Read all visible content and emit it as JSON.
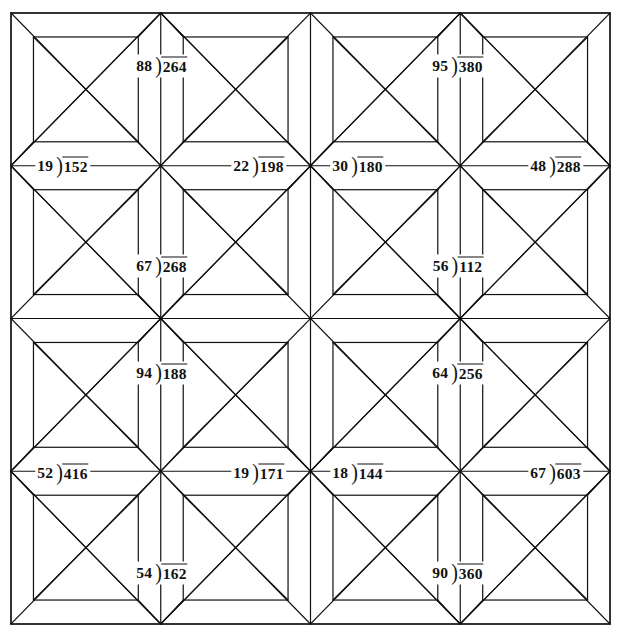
{
  "page": {
    "background_color": "#ffffff",
    "ink_color": "#111111",
    "width": 620,
    "height": 637
  },
  "quilt": {
    "frame": {
      "x": 11,
      "y": 13,
      "width": 599,
      "height": 611
    },
    "blocks_across": 2,
    "blocks_down": 2,
    "block_count": 4,
    "motif": "eight-pointed-star-with-corner-squares",
    "line_color": "#111111",
    "line_width": 1.2
  },
  "problems": [
    {
      "id": "b1-north",
      "block": 1,
      "position": "north",
      "divisor": "88",
      "bracket": ")",
      "dividend": "264",
      "x": 162,
      "y": 66
    },
    {
      "id": "b1-west",
      "block": 1,
      "position": "west",
      "divisor": "19",
      "bracket": ")",
      "dividend": "152",
      "x": 63,
      "y": 166
    },
    {
      "id": "b1-east",
      "block": 1,
      "position": "east",
      "divisor": "22",
      "bracket": ")",
      "dividend": "198",
      "x": 259,
      "y": 166
    },
    {
      "id": "b1-south",
      "block": 1,
      "position": "south",
      "divisor": "67",
      "bracket": ")",
      "dividend": "268",
      "x": 162,
      "y": 266
    },
    {
      "id": "b2-north",
      "block": 2,
      "position": "north",
      "divisor": "95",
      "bracket": ")",
      "dividend": "380",
      "x": 458,
      "y": 66
    },
    {
      "id": "b2-west",
      "block": 2,
      "position": "west",
      "divisor": "30",
      "bracket": ")",
      "dividend": "180",
      "x": 358,
      "y": 166
    },
    {
      "id": "b2-east",
      "block": 2,
      "position": "east",
      "divisor": "48",
      "bracket": ")",
      "dividend": "288",
      "x": 556,
      "y": 166
    },
    {
      "id": "b2-south",
      "block": 2,
      "position": "south",
      "divisor": "56",
      "bracket": ")",
      "dividend": "112",
      "x": 458,
      "y": 266
    },
    {
      "id": "b3-north",
      "block": 3,
      "position": "north",
      "divisor": "94",
      "bracket": ")",
      "dividend": "188",
      "x": 162,
      "y": 373
    },
    {
      "id": "b3-west",
      "block": 3,
      "position": "west",
      "divisor": "52",
      "bracket": ")",
      "dividend": "416",
      "x": 63,
      "y": 473
    },
    {
      "id": "b3-east",
      "block": 3,
      "position": "east",
      "divisor": "19",
      "bracket": ")",
      "dividend": "171",
      "x": 259,
      "y": 473
    },
    {
      "id": "b3-south",
      "block": 3,
      "position": "south",
      "divisor": "54",
      "bracket": ")",
      "dividend": "162",
      "x": 162,
      "y": 573
    },
    {
      "id": "b4-north",
      "block": 4,
      "position": "north",
      "divisor": "64",
      "bracket": ")",
      "dividend": "256",
      "x": 458,
      "y": 373
    },
    {
      "id": "b4-west",
      "block": 4,
      "position": "west",
      "divisor": "18",
      "bracket": ")",
      "dividend": "144",
      "x": 358,
      "y": 473
    },
    {
      "id": "b4-east",
      "block": 4,
      "position": "east",
      "divisor": "67",
      "bracket": ")",
      "dividend": "603",
      "x": 556,
      "y": 473
    },
    {
      "id": "b4-south",
      "block": 4,
      "position": "south",
      "divisor": "90",
      "bracket": ")",
      "dividend": "360",
      "x": 458,
      "y": 573
    }
  ]
}
